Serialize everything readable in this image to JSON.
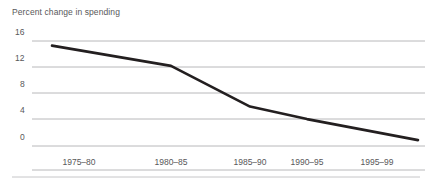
{
  "chart_data": {
    "type": "line",
    "title": "Percent change in spending",
    "xlabel": "",
    "ylabel": "",
    "categories": [
      "1975–80",
      "1980–85",
      "1985–90",
      "1990–95",
      "1995–99"
    ],
    "x": [
      0,
      1,
      2,
      3,
      4
    ],
    "values": [
      15.3,
      12.2,
      6.0,
      4.1,
      0.9
    ],
    "series": [
      {
        "name": "Percent change in spending",
        "values": [
          15.3,
          12.2,
          6.0,
          4.1,
          0.9
        ],
        "color": "#231f20",
        "line_width": 2.6
      }
    ],
    "ylim": [
      0,
      16
    ],
    "yticks": [
      0,
      4,
      8,
      12,
      16
    ],
    "ytick_labels": [
      "0",
      "4",
      "8",
      "12",
      "16"
    ],
    "xtick_labels": [
      "1975–80",
      "1980–85",
      "1985–90",
      "1990–95",
      "1995–99"
    ],
    "grid": true,
    "grid_axis": "y",
    "grid_color": "#b8b8ba",
    "legend": false,
    "legend_position": "none",
    "markers": false,
    "axis_line_color": "#b8b8ba",
    "text_color": "#58585a",
    "background": "#ffffff",
    "footer_rule": true,
    "footer_rule_color": "#c6c6c8"
  },
  "layout": {
    "plot_left": 32,
    "plot_right": 425,
    "y_top_px": 41,
    "y_bottom_px": 146,
    "first_point_x": 52,
    "last_point_x": 418,
    "xtick_centers": [
      79,
      171,
      250,
      307,
      377
    ],
    "xtick_label_y": 158,
    "footer_rule_y": 177
  }
}
